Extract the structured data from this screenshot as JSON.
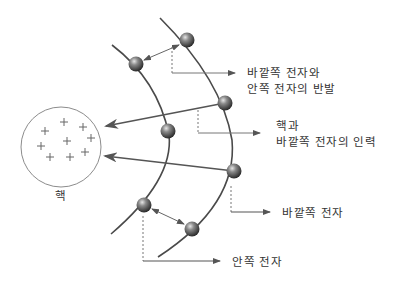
{
  "diagram": {
    "colors": {
      "line": "#4a4a4a",
      "arrow": "#666666",
      "electron_dark": "#2e2e2e",
      "electron_light": "#d0d0d0",
      "nucleus_outline": "#888888",
      "text": "#333333"
    },
    "nucleus": {
      "label": "핵",
      "charge_symbol": "+",
      "charge_count": 9
    },
    "labels": {
      "repulsion_line1": "바깥쪽 전자와",
      "repulsion_line2": "안쪽 전자의 반발",
      "attraction_line1": "핵과",
      "attraction_line2": "바깥쪽 전자의 인력",
      "outer_electron": "바깥쪽 전자",
      "inner_electron": "안쪽 전자"
    },
    "electrons": [
      {
        "id": "outer-top",
        "shell": "outer"
      },
      {
        "id": "inner-top",
        "shell": "inner"
      },
      {
        "id": "outer-upper-mid",
        "shell": "outer"
      },
      {
        "id": "inner-mid",
        "shell": "inner"
      },
      {
        "id": "outer-lower-mid",
        "shell": "outer"
      },
      {
        "id": "inner-bottom",
        "shell": "inner"
      },
      {
        "id": "outer-bottom",
        "shell": "outer"
      }
    ]
  }
}
